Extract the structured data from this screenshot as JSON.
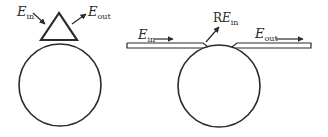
{
  "colors": {
    "stroke": "#2a2a2a",
    "background": "#ffffff"
  },
  "left_panel": {
    "label_in": {
      "main": "E",
      "sub": "in"
    },
    "label_out": {
      "main": "E",
      "sub": "out"
    },
    "coupler_shape": "prism-triangle",
    "resonator_shape": "ring-circle"
  },
  "right_panel": {
    "label_in": {
      "main": "E",
      "sub": "in"
    },
    "label_reflected": {
      "prefix": "R",
      "main": "E",
      "sub": "in"
    },
    "label_out": {
      "main": "E",
      "sub": "out"
    },
    "coupler_shape": "waveguide-split",
    "resonator_shape": "ring-circle"
  }
}
